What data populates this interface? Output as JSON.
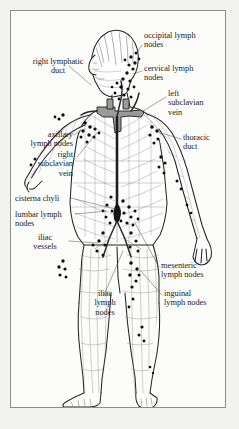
{
  "figure": {
    "domain_title": "Human Lymphatic System",
    "background_color": "#f2f2f0",
    "panel_color": "#fcfcfb",
    "border_color": "#8c8c8c",
    "ink_color": "#1a1a1a",
    "node_color": "#111111",
    "vessel_color": "#4a4a4a",
    "duct_color": "#2b2b2b"
  },
  "labels": [
    {
      "id": "occipital-lymph-nodes",
      "text": "occipital lymph\nnodes",
      "x": 133,
      "y": 20,
      "align": "left"
    },
    {
      "id": "right-lymphatic-duct",
      "text": "right lymphatic\nduct",
      "x": 10,
      "y": 46,
      "align": "left"
    },
    {
      "id": "cervical-lymph-nodes",
      "text": "cervical lymph\nnodes",
      "x": 133,
      "y": 53,
      "align": "left"
    },
    {
      "id": "left-subclavian-vein",
      "text": "left\nsubclavian\nvein",
      "x": 157,
      "y": 78,
      "align": "left"
    },
    {
      "id": "axillary-lymph-nodes",
      "text": "axillary\nlymph nodes",
      "x": 6,
      "y": 119,
      "align": "left"
    },
    {
      "id": "thoracic-duct",
      "text": "thoracic\nduct",
      "x": 172,
      "y": 122,
      "align": "left"
    },
    {
      "id": "right-subclavian-vein",
      "text": "right\nsubclavian\nvein",
      "x": 22,
      "y": 139,
      "align": "left"
    },
    {
      "id": "cisterna-chyli",
      "text": "cisterna chyli",
      "x": 10,
      "y": 183,
      "align": "left"
    },
    {
      "id": "lumbar-lymph-nodes",
      "text": "lumbar lymph\nnodes",
      "x": 10,
      "y": 199,
      "align": "left"
    },
    {
      "id": "iliac-vessels",
      "text": "iliac\nvessels",
      "x": 28,
      "y": 222,
      "align": "left"
    },
    {
      "id": "mesenteric-lymph-nodes",
      "text": "mesenteric\nlymph nodes",
      "x": 150,
      "y": 250,
      "align": "left"
    },
    {
      "id": "inguinal-lymph-nodes",
      "text": "inguinal\nlymph nodes",
      "x": 153,
      "y": 278,
      "align": "left"
    },
    {
      "id": "iliac-lymph-nodes",
      "text": "iliac\nlymph\nnodes",
      "x": 77,
      "y": 278,
      "align": "left"
    }
  ],
  "anatomy": {
    "figure_pose": "standing human body, anterior view, head turned in left profile, left arm raised and extended downward-right, legs slightly apart",
    "structures": [
      "occipital lymph nodes",
      "cervical lymph nodes",
      "right lymphatic duct",
      "left subclavian vein",
      "right subclavian vein",
      "thoracic duct",
      "axillary lymph nodes",
      "cisterna chyli",
      "lumbar lymph nodes",
      "iliac vessels",
      "iliac lymph nodes",
      "mesenteric lymph nodes",
      "inguinal lymph nodes",
      "superficial lymphatic vessel network"
    ]
  }
}
